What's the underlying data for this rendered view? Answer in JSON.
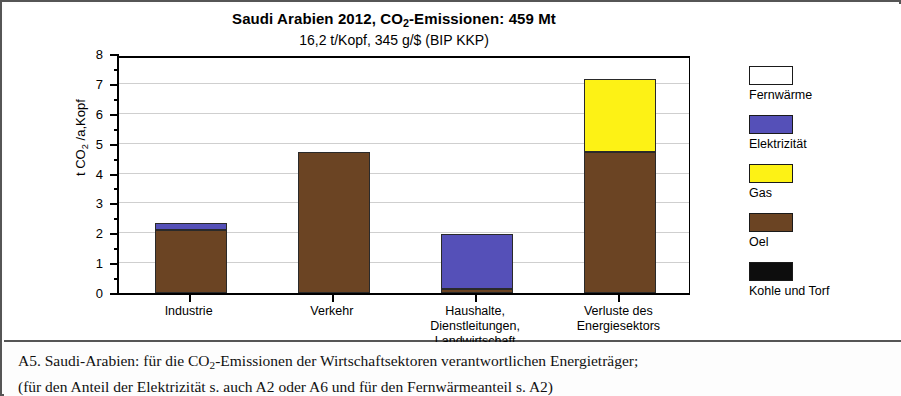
{
  "chart_data": {
    "type": "bar",
    "stacked": true,
    "title": "Saudi Arabien 2012, CO2-Emissionen:  459 Mt",
    "subtitle": "16,2 t/Kopf,    345 g/$  (BIP KKP)",
    "title_parts": {
      "before_sub": "Saudi Arabien 2012, CO",
      "sub": "2",
      "after_sub": "-Emissionen:  459 Mt"
    },
    "xlabel": "",
    "ylabel": "t CO2 /a,Kopf",
    "ylabel_parts": {
      "before_sub": "t CO",
      "sub": "2",
      "after_sub": " /a,Kopf"
    },
    "ylim": [
      0,
      8
    ],
    "ytick_labels": [
      "0",
      "1",
      "2",
      "3",
      "4",
      "5",
      "6",
      "7",
      "8"
    ],
    "ytick_values": [
      0,
      1,
      2,
      3,
      4,
      5,
      6,
      7,
      8
    ],
    "minor_tick_step": 0.5,
    "grid": true,
    "legend_position": "right",
    "categories": [
      "Industrie",
      "Verkehr",
      "Haushalte,\nDienstleitungen,\nLandwirtschaft",
      "Verluste des\nEnergiesektors"
    ],
    "series": [
      {
        "name": "Kohle und Torf",
        "color": "#0d0d0d",
        "values": [
          0,
          0,
          0,
          0
        ]
      },
      {
        "name": "Oel",
        "color": "#6b4423",
        "values": [
          2.1,
          4.73,
          0.15,
          4.73
        ]
      },
      {
        "name": "Gas",
        "color": "#fdf215",
        "values": [
          0,
          0,
          0,
          2.42
        ]
      },
      {
        "name": "Elektrizität",
        "color": "#5550b8",
        "values": [
          0.25,
          0,
          1.82,
          0
        ]
      },
      {
        "name": "Fernwärme",
        "color": "#ffffff",
        "values": [
          0,
          0,
          0,
          0
        ]
      }
    ],
    "totals": [
      2.35,
      4.73,
      1.97,
      7.15
    ]
  },
  "legend": {
    "entries": [
      {
        "label": "Fernwärme",
        "color": "#ffffff"
      },
      {
        "label": "Elektrizität",
        "color": "#5550b8"
      },
      {
        "label": "Gas",
        "color": "#fdf215"
      },
      {
        "label": "Oel",
        "color": "#6b4423"
      },
      {
        "label": "Kohle und Torf",
        "color": "#0d0d0d"
      }
    ]
  },
  "caption": {
    "line1": "A5.  Saudi-Arabien:  für die CO2-Emissionen der Wirtschaftsektoren verantwortlichen Energieträger;",
    "line1_parts": {
      "before_sub": "A5.  Saudi-Arabien:  für die CO",
      "sub": "2",
      "after_sub": "-Emissionen der Wirtschaftsektoren verantwortlichen Energieträger;"
    },
    "line2": "(für den Anteil der Elektrizität s. auch  A2 oder A6 und für den Fernwärmeanteil  s. A2)"
  }
}
